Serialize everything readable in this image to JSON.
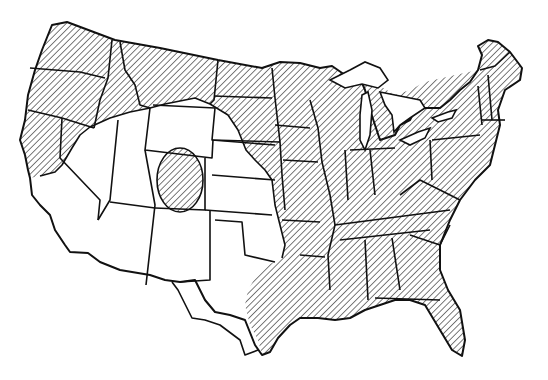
{
  "map": {
    "title": "Continental United States distribution map",
    "legend": [],
    "colors": {
      "background": "#ffffff",
      "lines": "#111111",
      "hatch": "#222222"
    },
    "regions": [
      {
        "name": "hatched-north-and-east",
        "pattern": "diagonal-hatch",
        "description": "Pacific Northwest, northern Rockies, northern plains edge, Midwest, South and East"
      },
      {
        "name": "hatched-colorado-oval",
        "pattern": "diagonal-hatch",
        "description": "Isolated oval region in central Colorado"
      },
      {
        "name": "unhatched-southwest-plains",
        "pattern": "none",
        "description": "California, Great Basin, Southwest, central/southern Great Plains, west Texas"
      }
    ]
  }
}
